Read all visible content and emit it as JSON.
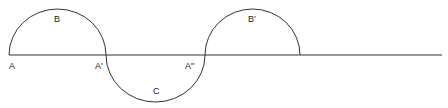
{
  "diagram": {
    "type": "wave-of-semicircles",
    "stroke_color": "#333333",
    "background": "#ffffff",
    "baseline": {
      "y": 55,
      "x_start": 9,
      "x_end": 442
    },
    "arcs": [
      {
        "id": "B",
        "from_x": 9,
        "to_x": 106,
        "direction": "up"
      },
      {
        "id": "C",
        "from_x": 106,
        "to_x": 205,
        "direction": "down"
      },
      {
        "id": "B'",
        "from_x": 205,
        "to_x": 300,
        "direction": "up"
      }
    ],
    "labels": {
      "A": "A",
      "A1": "A'",
      "A2": "A\"",
      "B": "B",
      "C": "C",
      "B1": "B'"
    }
  }
}
